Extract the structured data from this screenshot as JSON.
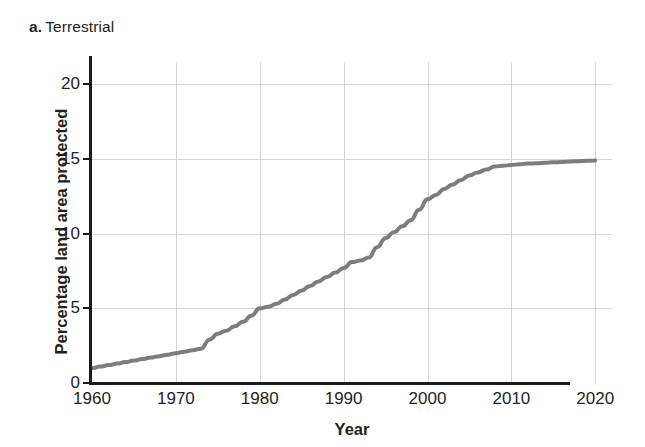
{
  "panel": {
    "letter": "a.",
    "name": "Terrestrial"
  },
  "axes": {
    "x_title": "Year",
    "y_title": "Percentage land area protected"
  },
  "chart_data": {
    "type": "line",
    "xlabel": "Year",
    "ylabel": "Percentage land area protected",
    "xlim": [
      1960,
      2022
    ],
    "ylim": [
      0,
      21.5
    ],
    "xticks": [
      1960,
      1970,
      1980,
      1990,
      2000,
      2010,
      2020
    ],
    "yticks": [
      0,
      5,
      10,
      15,
      20
    ],
    "grid": true,
    "legend": null,
    "line_color": "#7d7d7d",
    "line_width": 4,
    "series": [
      {
        "name": "Percentage land area protected",
        "x": [
          1960,
          1961,
          1962,
          1963,
          1964,
          1965,
          1966,
          1967,
          1968,
          1969,
          1970,
          1971,
          1972,
          1973,
          1974,
          1975,
          1976,
          1977,
          1978,
          1979,
          1980,
          1981,
          1982,
          1983,
          1984,
          1985,
          1986,
          1987,
          1988,
          1989,
          1990,
          1991,
          1992,
          1993,
          1994,
          1995,
          1996,
          1997,
          1998,
          1999,
          2000,
          2001,
          2002,
          2003,
          2004,
          2005,
          2006,
          2007,
          2008,
          2009,
          2010,
          2011,
          2012,
          2013,
          2014,
          2015,
          2016,
          2017,
          2018,
          2019,
          2020
        ],
        "values": [
          1.0,
          1.1,
          1.2,
          1.3,
          1.4,
          1.5,
          1.6,
          1.7,
          1.8,
          1.9,
          2.0,
          2.1,
          2.2,
          2.3,
          2.9,
          3.3,
          3.5,
          3.8,
          4.1,
          4.5,
          5.0,
          5.1,
          5.3,
          5.6,
          5.9,
          6.2,
          6.5,
          6.8,
          7.1,
          7.4,
          7.7,
          8.1,
          8.2,
          8.4,
          9.1,
          9.7,
          10.1,
          10.5,
          10.9,
          11.6,
          12.3,
          12.6,
          13.0,
          13.3,
          13.6,
          13.9,
          14.1,
          14.3,
          14.5,
          14.55,
          14.6,
          14.65,
          14.7,
          14.72,
          14.75,
          14.78,
          14.8,
          14.83,
          14.86,
          14.88,
          14.9
        ]
      }
    ]
  }
}
